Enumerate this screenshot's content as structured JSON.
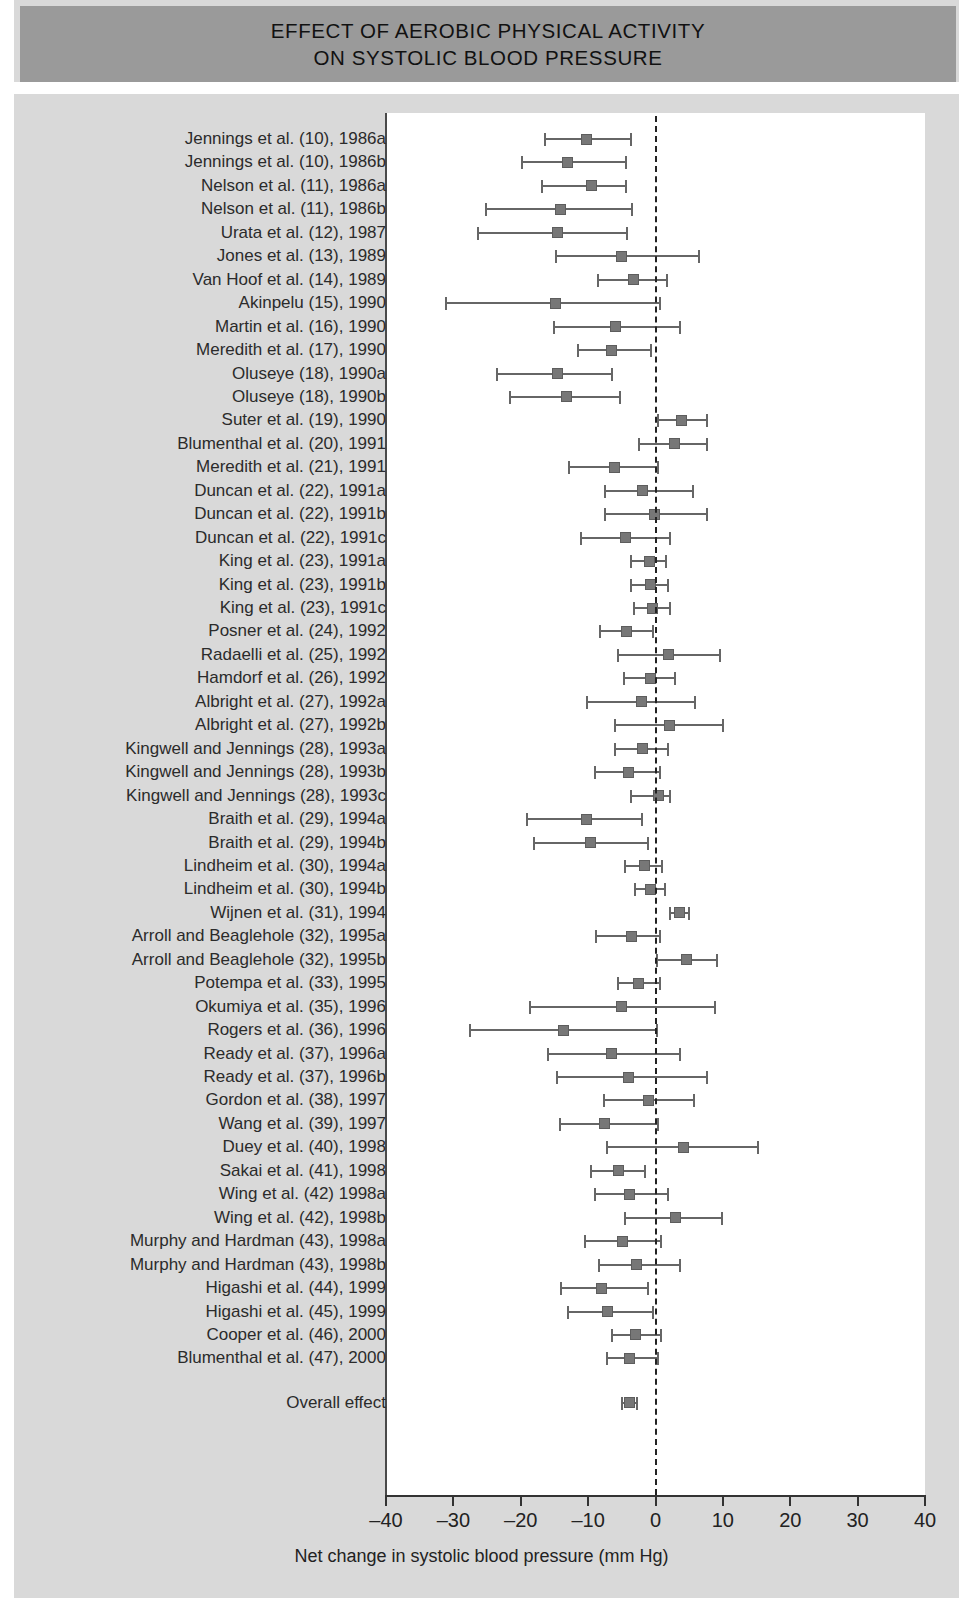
{
  "title": {
    "line1": "EFFECT OF AEROBIC PHYSICAL ACTIVITY",
    "line2": "ON SYSTOLIC BLOOD PRESSURE"
  },
  "colors": {
    "title_band": "#9a9a9a",
    "background": "#d9d9d9",
    "panel": "#ffffff",
    "marker": "#777777",
    "line": "#666666",
    "axis": "#333333"
  },
  "overall_label": "Overall effect",
  "chart_data": {
    "type": "forest",
    "title": "EFFECT OF AEROBIC PHYSICAL ACTIVITY ON SYSTOLIC BLOOD PRESSURE",
    "xlabel": "Net change in systolic blood pressure (mm Hg)",
    "ylabel": "",
    "xlim": [
      -40,
      40
    ],
    "xticks": [
      -40,
      -30,
      -20,
      -10,
      0,
      10,
      20,
      30,
      40
    ],
    "xticklabels": [
      "–40",
      "–30",
      "–20",
      "–10",
      "0",
      "10",
      "20",
      "30",
      "40"
    ],
    "reference_line": 0,
    "grid": false,
    "legend": null,
    "units": "mm Hg",
    "effect_measure": "Net change in systolic blood pressure",
    "studies": [
      {
        "label": "Jennings et al. (10), 1986a",
        "effect": -10.2,
        "ci_low": -16.4,
        "ci_high": -3.7
      },
      {
        "label": "Jennings et al. (10), 1986b",
        "effect": -13.1,
        "ci_low": -19.8,
        "ci_high": -4.4
      },
      {
        "label": "Nelson et al. (11), 1986a",
        "effect": -9.5,
        "ci_low": -16.8,
        "ci_high": -4.4
      },
      {
        "label": "Nelson et al. (11), 1986b",
        "effect": -14.1,
        "ci_low": -25.1,
        "ci_high": -3.5
      },
      {
        "label": "Urata et al. (12), 1987",
        "effect": -14.6,
        "ci_low": -26.4,
        "ci_high": -4.3
      },
      {
        "label": "Jones et al. (13), 1989",
        "effect": -5.0,
        "ci_low": -14.8,
        "ci_high": 6.4
      },
      {
        "label": "Van Hoof et al. (14), 1989",
        "effect": -3.3,
        "ci_low": -8.5,
        "ci_high": 1.7
      },
      {
        "label": "Akinpelu (15), 1990",
        "effect": -14.9,
        "ci_low": -31.1,
        "ci_high": 0.7
      },
      {
        "label": "Martin et al. (16), 1990",
        "effect": -6.0,
        "ci_low": -15.0,
        "ci_high": 3.7
      },
      {
        "label": "Meredith et al. (17), 1990",
        "effect": -6.5,
        "ci_low": -11.5,
        "ci_high": -0.6
      },
      {
        "label": "Oluseye (18), 1990a",
        "effect": -14.5,
        "ci_low": -23.5,
        "ci_high": -6.5
      },
      {
        "label": "Oluseye (18), 1990b",
        "effect": -13.2,
        "ci_low": -21.6,
        "ci_high": -5.3
      },
      {
        "label": "Suter et al. (19), 1990",
        "effect": 3.8,
        "ci_low": 0.3,
        "ci_high": 7.6
      },
      {
        "label": "Blumenthal et al. (20), 1991",
        "effect": 2.8,
        "ci_low": -2.4,
        "ci_high": 7.6
      },
      {
        "label": "Meredith et al. (21), 1991",
        "effect": -6.1,
        "ci_low": -12.8,
        "ci_high": 0.3
      },
      {
        "label": "Duncan et al. (22), 1991a",
        "effect": -2.0,
        "ci_low": -7.5,
        "ci_high": 5.6
      },
      {
        "label": "Duncan et al. (22), 1991b",
        "effect": -0.1,
        "ci_low": -7.5,
        "ci_high": 7.7
      },
      {
        "label": "Duncan et al. (22), 1991c",
        "effect": -4.4,
        "ci_low": -11.1,
        "ci_high": 2.1
      },
      {
        "label": "King et al. (23), 1991a",
        "effect": -0.9,
        "ci_low": -3.6,
        "ci_high": 1.6
      },
      {
        "label": "King et al. (23), 1991b",
        "effect": -0.8,
        "ci_low": -3.6,
        "ci_high": 1.8
      },
      {
        "label": "King et al. (23), 1991c",
        "effect": -0.5,
        "ci_low": -3.2,
        "ci_high": 2.1
      },
      {
        "label": "Posner et al. (24), 1992",
        "effect": -4.3,
        "ci_low": -8.2,
        "ci_high": -0.3
      },
      {
        "label": "Radaelli et al. (25), 1992",
        "effect": 2.0,
        "ci_low": -5.5,
        "ci_high": 9.5
      },
      {
        "label": "Hamdorf et al. (26), 1992",
        "effect": -0.7,
        "ci_low": -4.7,
        "ci_high": 2.9
      },
      {
        "label": "Albright et al. (27), 1992a",
        "effect": -2.1,
        "ci_low": -10.2,
        "ci_high": 5.9
      },
      {
        "label": "Albright et al. (27), 1992b",
        "effect": 2.1,
        "ci_low": -6.0,
        "ci_high": 10.0
      },
      {
        "label": "Kingwell and Jennings (28), 1993a",
        "effect": -2.0,
        "ci_low": -6.0,
        "ci_high": 1.8
      },
      {
        "label": "Kingwell and Jennings (28), 1993b",
        "effect": -4.0,
        "ci_low": -9.0,
        "ci_high": 0.6
      },
      {
        "label": "Kingwell and Jennings (28), 1993c",
        "effect": 0.5,
        "ci_low": -3.6,
        "ci_high": 2.2
      },
      {
        "label": "Braith et al. (29), 1994a",
        "effect": -10.2,
        "ci_low": -19.0,
        "ci_high": -2.0
      },
      {
        "label": "Braith et al. (29), 1994b",
        "effect": -9.6,
        "ci_low": -18.1,
        "ci_high": -1.1
      },
      {
        "label": "Lindheim et al. (30), 1994a",
        "effect": -1.6,
        "ci_low": -4.5,
        "ci_high": 1.0
      },
      {
        "label": "Lindheim et al. (30), 1994b",
        "effect": -0.7,
        "ci_low": -3.0,
        "ci_high": 1.4
      },
      {
        "label": "Wijnen et al. (31), 1994",
        "effect": 3.5,
        "ci_low": 2.1,
        "ci_high": 5.0
      },
      {
        "label": "Arroll and Beaglehole (32), 1995a",
        "effect": -3.5,
        "ci_low": -8.8,
        "ci_high": 0.6
      },
      {
        "label": "Arroll and Beaglehole (32), 1995b",
        "effect": 4.6,
        "ci_low": 0.2,
        "ci_high": 9.1
      },
      {
        "label": "Potempa et al. (33), 1995",
        "effect": -2.5,
        "ci_low": -5.5,
        "ci_high": 0.7
      },
      {
        "label": "Okumiya et al. (35), 1996",
        "effect": -5.0,
        "ci_low": -18.7,
        "ci_high": 8.8
      },
      {
        "label": "Rogers et al. (36), 1996",
        "effect": -13.6,
        "ci_low": -27.5,
        "ci_high": 0.2
      },
      {
        "label": "Ready et al. (37), 1996a",
        "effect": -6.6,
        "ci_low": -16.0,
        "ci_high": 3.6
      },
      {
        "label": "Ready et al. (37), 1996b",
        "effect": -4.0,
        "ci_low": -14.6,
        "ci_high": 7.7
      },
      {
        "label": "Gordon et al. (38), 1997",
        "effect": -1.0,
        "ci_low": -7.6,
        "ci_high": 5.7
      },
      {
        "label": "Wang et al. (39), 1997",
        "effect": -7.5,
        "ci_low": -14.2,
        "ci_high": 0.3
      },
      {
        "label": "Duey et al. (40), 1998",
        "effect": 4.2,
        "ci_low": -7.2,
        "ci_high": 15.2
      },
      {
        "label": "Sakai et al. (41), 1998",
        "effect": -5.5,
        "ci_low": -9.6,
        "ci_high": -1.6
      },
      {
        "label": "Wing et al. (42) 1998a",
        "effect": -3.8,
        "ci_low": -9.0,
        "ci_high": 1.8
      },
      {
        "label": "Wing et al. (42), 1998b",
        "effect": 3.0,
        "ci_low": -4.5,
        "ci_high": 9.9
      },
      {
        "label": "Murphy and Hardman (43), 1998a",
        "effect": -4.9,
        "ci_low": -10.5,
        "ci_high": 0.8
      },
      {
        "label": "Murphy and Hardman (43), 1998b",
        "effect": -2.8,
        "ci_low": -8.4,
        "ci_high": 3.6
      },
      {
        "label": "Higashi et al. (44), 1999",
        "effect": -8.0,
        "ci_low": -14.1,
        "ci_high": -1.1
      },
      {
        "label": "Higashi et al. (45), 1999",
        "effect": -7.1,
        "ci_low": -13.0,
        "ci_high": -0.3
      },
      {
        "label": "Cooper et al. (46), 2000",
        "effect": -3.0,
        "ci_low": -6.5,
        "ci_high": 0.8
      },
      {
        "label": "Blumenthal et al. (47), 2000",
        "effect": -3.8,
        "ci_low": -7.2,
        "ci_high": 0.3
      }
    ],
    "overall": {
      "label": "Overall effect",
      "effect": -3.8,
      "ci_low": -4.9,
      "ci_high": -2.7
    }
  }
}
